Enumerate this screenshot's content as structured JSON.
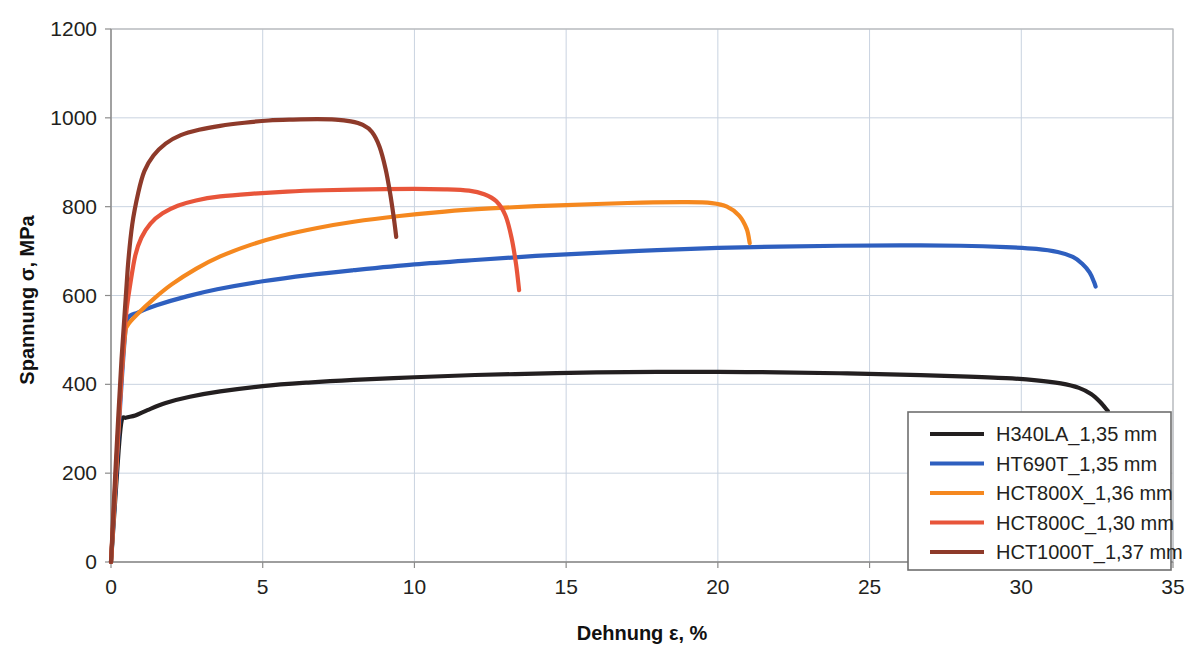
{
  "chart_data": {
    "type": "line",
    "title": "",
    "xlabel": "Dehnung ε, %",
    "ylabel": "Spannung σ, MPa",
    "xlim": [
      0,
      35
    ],
    "ylim": [
      0,
      1200
    ],
    "xticks": [
      "0",
      "5",
      "10",
      "15",
      "20",
      "25",
      "30",
      "35"
    ],
    "yticks": [
      "0",
      "200",
      "400",
      "600",
      "800",
      "1000",
      "1200"
    ],
    "xtick_values": [
      0,
      5,
      10,
      15,
      20,
      25,
      30,
      35
    ],
    "ytick_values": [
      0,
      200,
      400,
      600,
      800,
      1000,
      1200
    ],
    "grid": true,
    "legend_position": "lower right",
    "series": [
      {
        "name": "H340LA_1,35 mm",
        "color": "#231f20",
        "yield_strength": 325,
        "tensile_strength": 428,
        "elongation": 33.0,
        "points": [
          [
            0.0,
            0
          ],
          [
            0.12,
            120
          ],
          [
            0.25,
            250
          ],
          [
            0.35,
            318
          ],
          [
            0.5,
            325
          ],
          [
            0.8,
            330
          ],
          [
            1.2,
            342
          ],
          [
            1.8,
            358
          ],
          [
            2.6,
            372
          ],
          [
            3.6,
            384
          ],
          [
            5.0,
            396
          ],
          [
            6.5,
            404
          ],
          [
            8.0,
            410
          ],
          [
            10.0,
            416
          ],
          [
            12.0,
            421
          ],
          [
            14.0,
            424
          ],
          [
            16.0,
            427
          ],
          [
            18.0,
            428
          ],
          [
            20.0,
            428
          ],
          [
            22.0,
            427
          ],
          [
            24.0,
            425
          ],
          [
            26.0,
            422
          ],
          [
            28.0,
            418
          ],
          [
            29.5,
            414
          ],
          [
            30.5,
            409
          ],
          [
            31.3,
            402
          ],
          [
            31.9,
            392
          ],
          [
            32.3,
            378
          ],
          [
            32.6,
            360
          ],
          [
            32.85,
            340
          ]
        ]
      },
      {
        "name": "HT690T_1,35 mm",
        "color": "#2e5fbf",
        "yield_strength": 548,
        "tensile_strength": 713,
        "elongation": 32.4,
        "points": [
          [
            0.0,
            0
          ],
          [
            0.15,
            170
          ],
          [
            0.3,
            350
          ],
          [
            0.45,
            500
          ],
          [
            0.55,
            548
          ],
          [
            0.9,
            562
          ],
          [
            1.5,
            578
          ],
          [
            2.5,
            598
          ],
          [
            3.5,
            614
          ],
          [
            5.0,
            632
          ],
          [
            6.5,
            646
          ],
          [
            8.0,
            657
          ],
          [
            10.0,
            670
          ],
          [
            12.0,
            680
          ],
          [
            14.0,
            689
          ],
          [
            16.0,
            696
          ],
          [
            18.0,
            702
          ],
          [
            20.0,
            707
          ],
          [
            22.0,
            710
          ],
          [
            24.0,
            712
          ],
          [
            26.0,
            713
          ],
          [
            28.0,
            712
          ],
          [
            29.5,
            709
          ],
          [
            30.5,
            705
          ],
          [
            31.2,
            698
          ],
          [
            31.7,
            687
          ],
          [
            32.0,
            672
          ],
          [
            32.25,
            652
          ],
          [
            32.4,
            630
          ],
          [
            32.45,
            620
          ]
        ]
      },
      {
        "name": "HCT800X_1,36 mm",
        "color": "#f5881f",
        "yield_strength": 520,
        "tensile_strength": 810,
        "elongation": 21.0,
        "points": [
          [
            0.0,
            0
          ],
          [
            0.15,
            180
          ],
          [
            0.3,
            370
          ],
          [
            0.45,
            505
          ],
          [
            0.55,
            533
          ],
          [
            0.9,
            560
          ],
          [
            1.4,
            592
          ],
          [
            2.0,
            625
          ],
          [
            2.8,
            660
          ],
          [
            3.6,
            688
          ],
          [
            4.6,
            714
          ],
          [
            5.6,
            734
          ],
          [
            6.8,
            752
          ],
          [
            8.0,
            766
          ],
          [
            9.5,
            779
          ],
          [
            11.0,
            789
          ],
          [
            12.5,
            796
          ],
          [
            14.0,
            801
          ],
          [
            16.0,
            806
          ],
          [
            17.5,
            809
          ],
          [
            19.0,
            810
          ],
          [
            19.8,
            808
          ],
          [
            20.3,
            800
          ],
          [
            20.7,
            780
          ],
          [
            20.95,
            750
          ],
          [
            21.05,
            718
          ]
        ]
      },
      {
        "name": "HCT800C_1,30 mm",
        "color": "#e8553a",
        "yield_strength": 560,
        "tensile_strength": 840,
        "elongation": 13.4,
        "points": [
          [
            0.0,
            0
          ],
          [
            0.15,
            185
          ],
          [
            0.32,
            390
          ],
          [
            0.48,
            545
          ],
          [
            0.6,
            610
          ],
          [
            0.8,
            690
          ],
          [
            1.0,
            730
          ],
          [
            1.3,
            762
          ],
          [
            1.7,
            785
          ],
          [
            2.2,
            802
          ],
          [
            2.8,
            814
          ],
          [
            3.6,
            823
          ],
          [
            4.6,
            829
          ],
          [
            5.8,
            834
          ],
          [
            7.0,
            837
          ],
          [
            8.5,
            839
          ],
          [
            10.0,
            840
          ],
          [
            11.0,
            839
          ],
          [
            11.8,
            836
          ],
          [
            12.3,
            828
          ],
          [
            12.7,
            812
          ],
          [
            13.0,
            780
          ],
          [
            13.2,
            730
          ],
          [
            13.35,
            670
          ],
          [
            13.45,
            612
          ]
        ]
      },
      {
        "name": "HCT1000T_1,37 mm",
        "color": "#8e3a2a",
        "yield_strength": 700,
        "tensile_strength": 997,
        "elongation": 9.4,
        "points": [
          [
            0.0,
            0
          ],
          [
            0.15,
            210
          ],
          [
            0.35,
            460
          ],
          [
            0.55,
            660
          ],
          [
            0.7,
            760
          ],
          [
            0.9,
            832
          ],
          [
            1.1,
            880
          ],
          [
            1.4,
            915
          ],
          [
            1.8,
            942
          ],
          [
            2.3,
            961
          ],
          [
            2.9,
            973
          ],
          [
            3.6,
            982
          ],
          [
            4.4,
            989
          ],
          [
            5.2,
            994
          ],
          [
            6.0,
            996
          ],
          [
            6.8,
            997
          ],
          [
            7.4,
            996
          ],
          [
            7.9,
            992
          ],
          [
            8.3,
            984
          ],
          [
            8.6,
            968
          ],
          [
            8.85,
            935
          ],
          [
            9.05,
            885
          ],
          [
            9.2,
            830
          ],
          [
            9.32,
            775
          ],
          [
            9.4,
            732
          ]
        ]
      }
    ]
  },
  "legend": {
    "items": [
      {
        "label": "H340LA_1,35 mm",
        "color": "#231f20"
      },
      {
        "label": "HT690T_1,35 mm",
        "color": "#2e5fbf"
      },
      {
        "label": "HCT800X_1,36 mm",
        "color": "#f5881f"
      },
      {
        "label": "HCT800C_1,30 mm",
        "color": "#e8553a"
      },
      {
        "label": "HCT1000T_1,37 mm",
        "color": "#8e3a2a"
      }
    ]
  },
  "style": {
    "grid_color": "#c9d3e0",
    "frame_color": "#b8b8b8",
    "legend_border": "#6f6f6f",
    "background": "#ffffff"
  }
}
